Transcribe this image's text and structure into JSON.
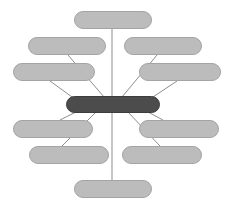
{
  "diagram": {
    "type": "mind-map",
    "title": "",
    "canvas": {
      "width": 226,
      "height": 207,
      "background": "#ffffff"
    },
    "style": {
      "branch_fill": "#bcbcbc",
      "branch_stroke": "#a4a4a4",
      "center_fill": "#4c4c4c",
      "center_stroke": "#3d3d3d",
      "connector_stroke": "#808080"
    },
    "center": {
      "label": "",
      "x": 66,
      "y": 96,
      "width": 94,
      "height": 17
    },
    "branches": [
      {
        "name": "branch-top",
        "label": "",
        "x": 74,
        "y": 11,
        "width": 78,
        "height": 18
      },
      {
        "name": "branch-left-1",
        "label": "",
        "x": 28,
        "y": 37,
        "width": 78,
        "height": 18
      },
      {
        "name": "branch-left-2",
        "label": "",
        "x": 13,
        "y": 63,
        "width": 82,
        "height": 18
      },
      {
        "name": "branch-left-3",
        "label": "",
        "x": 13,
        "y": 120,
        "width": 80,
        "height": 18
      },
      {
        "name": "branch-left-4",
        "label": "",
        "x": 29,
        "y": 146,
        "width": 80,
        "height": 18
      },
      {
        "name": "branch-right-1",
        "label": "",
        "x": 124,
        "y": 37,
        "width": 78,
        "height": 18
      },
      {
        "name": "branch-right-2",
        "label": "",
        "x": 139,
        "y": 63,
        "width": 82,
        "height": 18
      },
      {
        "name": "branch-right-3",
        "label": "",
        "x": 139,
        "y": 120,
        "width": 80,
        "height": 18
      },
      {
        "name": "branch-right-4",
        "label": "",
        "x": 122,
        "y": 146,
        "width": 80,
        "height": 18
      },
      {
        "name": "branch-bottom",
        "label": "",
        "x": 74,
        "y": 180,
        "width": 78,
        "height": 18
      }
    ],
    "connectors": [
      {
        "name": "connector-top",
        "x1": 112,
        "y1": 29,
        "x2": 112,
        "y2": 96
      },
      {
        "name": "connector-left-1",
        "x1": 68,
        "y1": 55,
        "x2": 104,
        "y2": 97
      },
      {
        "name": "connector-left-2",
        "x1": 50,
        "y1": 81,
        "x2": 72,
        "y2": 97
      },
      {
        "name": "connector-left-3",
        "x1": 60,
        "y1": 120,
        "x2": 76,
        "y2": 112
      },
      {
        "name": "connector-left-4",
        "x1": 62,
        "y1": 146,
        "x2": 96,
        "y2": 112
      },
      {
        "name": "connector-right-1",
        "x1": 157,
        "y1": 55,
        "x2": 122,
        "y2": 97
      },
      {
        "name": "connector-right-2",
        "x1": 177,
        "y1": 81,
        "x2": 153,
        "y2": 97
      },
      {
        "name": "connector-right-3",
        "x1": 163,
        "y1": 120,
        "x2": 148,
        "y2": 112
      },
      {
        "name": "connector-right-4",
        "x1": 160,
        "y1": 146,
        "x2": 128,
        "y2": 112
      },
      {
        "name": "connector-bottom",
        "x1": 112,
        "y1": 112,
        "x2": 112,
        "y2": 180
      }
    ]
  }
}
